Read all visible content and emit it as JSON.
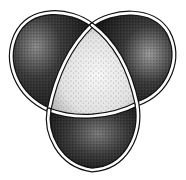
{
  "figure": {
    "style": "stippled pen-and-ink",
    "colors": {
      "background": "#ffffff",
      "ink": "#111111",
      "dark_lobe": "#2a2a2a",
      "light_center": "#e6e6e6",
      "band": "#ffffff"
    },
    "regions": [
      {
        "name": "top-left-lobe",
        "tone": "dark"
      },
      {
        "name": "top-right-lobe",
        "tone": "dark"
      },
      {
        "name": "bottom-lobe",
        "tone": "dark"
      },
      {
        "name": "center-triangle",
        "tone": "light"
      }
    ],
    "crossings": [
      {
        "name": "top",
        "x": 92,
        "y": 25
      },
      {
        "name": "left",
        "x": 49,
        "y": 110
      },
      {
        "name": "right",
        "x": 137,
        "y": 104
      }
    ]
  }
}
